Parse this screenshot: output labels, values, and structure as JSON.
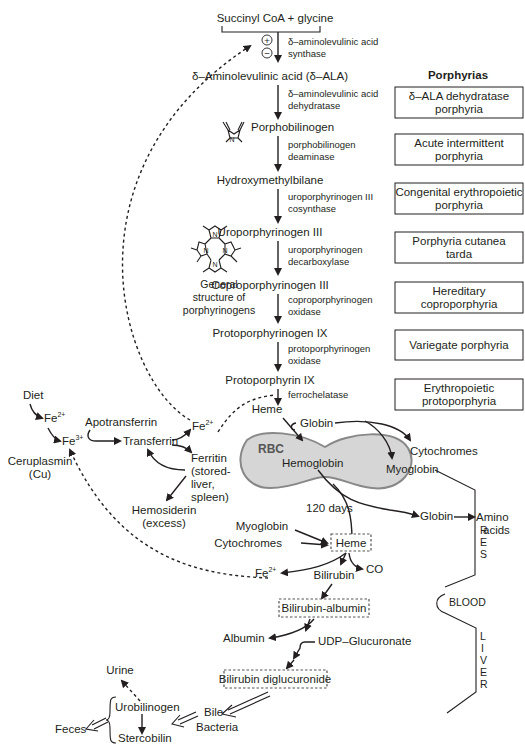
{
  "pathway": {
    "start": "Succinyl CoA + glycine",
    "regulation": {
      "plus": "+",
      "minus": "−"
    },
    "steps": [
      {
        "enzyme_line1": "δ–aminolevulinic acid",
        "enzyme_line2": "synthase",
        "product": "δ–Aminolevulinic acid (δ–ALA)"
      },
      {
        "enzyme_line1": "δ–aminolevulinic acid",
        "enzyme_line2": "dehydratase",
        "product": "Porphobilinogen"
      },
      {
        "enzyme_line1": "porphobilinogen",
        "enzyme_line2": "deaminase",
        "product": "Hydroxymethylbilane"
      },
      {
        "enzyme_line1": "uroporphyrinogen III",
        "enzyme_line2": "cosynthase",
        "product": "Uroporphyrinogen III"
      },
      {
        "enzyme_line1": "uroporphyrinogen",
        "enzyme_line2": "decarboxylase",
        "product": "Coproporphyrinogen III"
      },
      {
        "enzyme_line1": "coproporphyrinogen",
        "enzyme_line2": "oxidase",
        "product": "Protoporphyrinogen IX"
      },
      {
        "enzyme_line1": "protoporphyrinogen",
        "enzyme_line2": "oxidase",
        "product": "Protoporphyrin IX"
      },
      {
        "enzyme_line1": "ferrochelatase",
        "enzyme_line2": "",
        "product": "Heme"
      }
    ],
    "structure_caption": [
      "General",
      "structure of",
      "porphyrinogens"
    ]
  },
  "porphyrias": {
    "title": "Porphyrias",
    "items": [
      {
        "line1": "δ–ALA dehydratase",
        "line2": "porphyria"
      },
      {
        "line1": "Acute intermittent",
        "line2": "porphyria"
      },
      {
        "line1": "Congenital erythropoietic",
        "line2": "porphyria"
      },
      {
        "line1": "Porphyria cutanea",
        "line2": "tarda"
      },
      {
        "line1": "Hereditary",
        "line2": "coproporphyria"
      },
      {
        "line1": "Variegate porphyria",
        "line2": ""
      },
      {
        "line1": "Erythropoietic",
        "line2": "protoporphyria"
      }
    ]
  },
  "iron": {
    "diet": "Diet",
    "fe2": "Fe",
    "fe2_sup": "2+",
    "fe3": "Fe",
    "fe3_sup": "3+",
    "ceruloplasmin": [
      "Ceruplasmin",
      "(Cu)"
    ],
    "apotransferrin": "Apotransferrin",
    "transferrin": "Transferrin",
    "fe2_out": "Fe",
    "fe2_out_sup": "2+",
    "ferritin": [
      "Ferritin",
      "(stored-",
      "liver,",
      "spleen)"
    ],
    "hemosiderin": [
      "Hemosiderin",
      "(excess)"
    ]
  },
  "rbc": {
    "label": "RBC",
    "hemoglobin": "Hemoglobin",
    "globin": "Globin",
    "cytochromes": "Cytochromes",
    "myoglobin": "Myoglobin",
    "lifespan": "120 days",
    "fill_color": "#d6d6d6"
  },
  "degradation": {
    "myoglobin": "Myoglobin",
    "cytochromes": "Cytochromes",
    "heme": "Heme",
    "globin": "Globin",
    "amino_acids": [
      "Amino",
      "acids"
    ],
    "fe2": "Fe",
    "fe2_sup": "2+",
    "bilirubin": "Bilirubin",
    "co": "CO",
    "bilirubin_albumin": "Bilirubin-albumin",
    "albumin": "Albumin",
    "udp": "UDP–Glucuronate",
    "bilirubin_diglucuronide": "Bilirubin diglucuronide",
    "bile": "Bile",
    "bacteria": "Bacteria",
    "urobilinogen": "Urobilinogen",
    "stercobilin": "Stercobilin",
    "urine": "Urine",
    "feces": "Feces"
  },
  "compartments": {
    "res": [
      "R",
      "E",
      "S"
    ],
    "blood": "BLOOD",
    "liver": [
      "L",
      "I",
      "V",
      "E",
      "R"
    ]
  }
}
